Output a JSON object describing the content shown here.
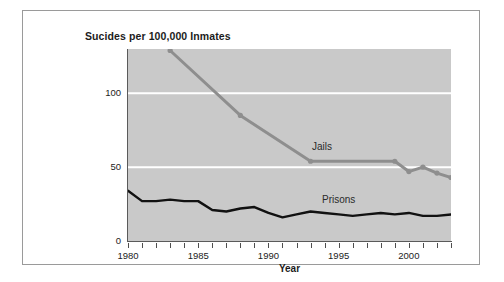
{
  "figure": {
    "background_color": "#ffffff",
    "frame_border_color": "#9a9a9a",
    "plot_background_color": "#c9c9c9",
    "gridline_color": "#ffffff",
    "axis_color": "#5a5a5a"
  },
  "chart_data": {
    "type": "line",
    "title": "Sucides per 100,000 Inmates",
    "xlabel": "Year",
    "ylabel": "",
    "xlim": [
      1980,
      2003
    ],
    "ylim": [
      0,
      130
    ],
    "ytick_labels": [
      "0",
      "50",
      "100"
    ],
    "ytick_values": [
      0,
      50,
      100
    ],
    "xtick_labels": [
      "1980",
      "1985",
      "1990",
      "1995",
      "2000"
    ],
    "xtick_values": [
      1980,
      1985,
      1990,
      1995,
      2000
    ],
    "grid": "horizontal white gridlines at 50 and 100",
    "legend_position": "inline labels on plot",
    "series": [
      {
        "name": "Jails",
        "color": "#8e8e8e",
        "marker": "circle",
        "x": [
          1983,
          1988,
          1993,
          1999,
          2000,
          2001,
          2002,
          2003
        ],
        "values": [
          129,
          85,
          54,
          54,
          47,
          50,
          46,
          43
        ]
      },
      {
        "name": "Prisons",
        "color": "#111111",
        "marker": "none",
        "x": [
          1980,
          1981,
          1982,
          1983,
          1984,
          1985,
          1986,
          1987,
          1988,
          1989,
          1990,
          1991,
          1992,
          1993,
          1994,
          1995,
          1996,
          1997,
          1998,
          1999,
          2000,
          2001,
          2002,
          2003
        ],
        "values": [
          34,
          27,
          27,
          28,
          27,
          27,
          21,
          20,
          22,
          23,
          19,
          16,
          18,
          20,
          19,
          18,
          17,
          18,
          19,
          18,
          19,
          17,
          17,
          18
        ]
      }
    ]
  }
}
